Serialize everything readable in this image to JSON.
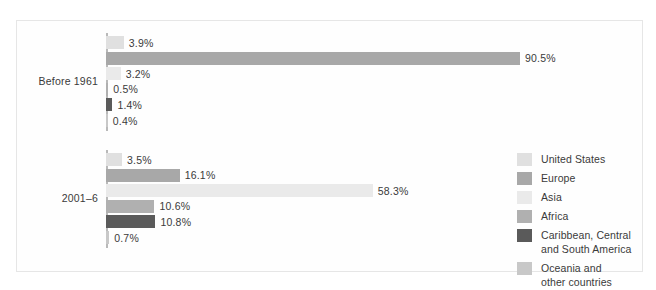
{
  "chart_data": {
    "type": "bar",
    "orientation": "horizontal",
    "title": "",
    "subtitle": "",
    "xlabel": "",
    "ylabel": "",
    "grid": false,
    "legend_position": "right",
    "xlim": [
      0,
      90.5
    ],
    "categories": [
      "Before 1961",
      "2001–6"
    ],
    "series": [
      {
        "name": "United States",
        "color": "#e0e0e0",
        "values": [
          3.9,
          3.5
        ]
      },
      {
        "name": "Europe",
        "color": "#a8a8a8",
        "values": [
          90.5,
          16.1
        ]
      },
      {
        "name": "Asia",
        "color": "#eaeaea",
        "values": [
          3.2,
          58.3
        ]
      },
      {
        "name": "Africa",
        "color": "#b0b0b0",
        "values": [
          0.5,
          10.6
        ]
      },
      {
        "name": "Caribbean, Central and South America",
        "color": "#5a5a5a",
        "values": [
          1.4,
          10.8
        ]
      },
      {
        "name": "Oceania and other countries",
        "color": "#c8c8c8",
        "values": [
          0.4,
          0.7
        ]
      }
    ]
  },
  "groups": [
    {
      "label": "Before 1961",
      "bars": [
        {
          "series": "United States",
          "value_label": "3.9%",
          "value": 3.9,
          "color": "#e0e0e0"
        },
        {
          "series": "Europe",
          "value_label": "90.5%",
          "value": 90.5,
          "color": "#a8a8a8"
        },
        {
          "series": "Asia",
          "value_label": "3.2%",
          "value": 3.2,
          "color": "#eaeaea"
        },
        {
          "series": "Africa",
          "value_label": "0.5%",
          "value": 0.5,
          "color": "#b0b0b0"
        },
        {
          "series": "Caribbean, Central and South America",
          "value_label": "1.4%",
          "value": 1.4,
          "color": "#5a5a5a"
        },
        {
          "series": "Oceania and other countries",
          "value_label": "0.4%",
          "value": 0.4,
          "color": "#c8c8c8"
        }
      ]
    },
    {
      "label": "2001–6",
      "bars": [
        {
          "series": "United States",
          "value_label": "3.5%",
          "value": 3.5,
          "color": "#e0e0e0"
        },
        {
          "series": "Europe",
          "value_label": "16.1%",
          "value": 16.1,
          "color": "#a8a8a8"
        },
        {
          "series": "Asia",
          "value_label": "58.3%",
          "value": 58.3,
          "color": "#eaeaea"
        },
        {
          "series": "Africa",
          "value_label": "10.6%",
          "value": 10.6,
          "color": "#b0b0b0"
        },
        {
          "series": "Caribbean, Central and South America",
          "value_label": "10.8%",
          "value": 10.8,
          "color": "#5a5a5a"
        },
        {
          "series": "Oceania and other countries",
          "value_label": "0.7%",
          "value": 0.7,
          "color": "#c8c8c8"
        }
      ]
    }
  ],
  "legend": {
    "items": [
      {
        "label": "United States",
        "color": "#e0e0e0"
      },
      {
        "label": "Europe",
        "color": "#a8a8a8"
      },
      {
        "label": "Asia",
        "color": "#eaeaea"
      },
      {
        "label": "Africa",
        "color": "#b0b0b0"
      },
      {
        "label": "Caribbean, Central\nand South America",
        "color": "#5a5a5a"
      },
      {
        "label": "Oceania and\nother countries",
        "color": "#c8c8c8"
      }
    ]
  },
  "style": {
    "frame_color": "#e6e6e6",
    "axis_color": "#b9b9b9",
    "text_color": "#3a3a3a",
    "background": "#ffffff"
  }
}
